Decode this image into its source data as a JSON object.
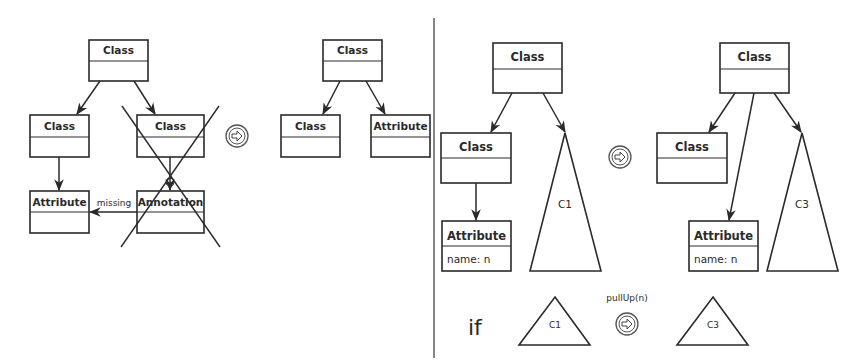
{
  "left_panel": {
    "before": {
      "root": {
        "title": "Class"
      },
      "left_child": {
        "title": "Class"
      },
      "right_child": {
        "title": "Class",
        "crossed_out": true
      },
      "attribute": {
        "title": "Attribute"
      },
      "annotation": {
        "title": "Annotation",
        "crossed_out": true
      },
      "missing_edge_label": "missing"
    },
    "transform_icon": "arrow-circle-icon",
    "after": {
      "root": {
        "title": "Class"
      },
      "left_child": {
        "title": "Class"
      },
      "right_child": {
        "title": "Attribute"
      }
    }
  },
  "right_panel": {
    "before": {
      "root": {
        "title": "Class"
      },
      "child_class": {
        "title": "Class"
      },
      "attribute": {
        "title": "Attribute",
        "field": "name: n"
      },
      "subtree": {
        "label": "C1"
      }
    },
    "transform_icon": "arrow-circle-icon",
    "after": {
      "root": {
        "title": "Class"
      },
      "child_class": {
        "title": "Class"
      },
      "attribute": {
        "title": "Attribute",
        "field": "name: n"
      },
      "subtree": {
        "label": "C3"
      }
    },
    "condition": {
      "keyword": "if",
      "from_subtree": "C1",
      "operation": "pullUp(n)",
      "to_subtree": "C3"
    }
  }
}
